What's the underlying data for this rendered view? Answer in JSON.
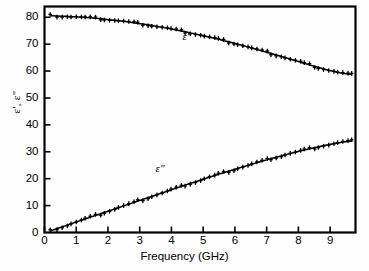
{
  "chart_data": {
    "type": "line",
    "title": "",
    "xlabel": "Frequency (GHz)",
    "ylabel": "ε', ε\"",
    "xlim": [
      0,
      9.8
    ],
    "ylim": [
      0,
      84
    ],
    "xticks": [
      0,
      1,
      2,
      3,
      4,
      5,
      6,
      7,
      8,
      9
    ],
    "xticklabels": [
      "0",
      "1",
      "2",
      "3",
      "4",
      "5",
      "6",
      "7",
      "8",
      "9"
    ],
    "yticks": [
      0,
      10,
      20,
      30,
      40,
      50,
      60,
      70,
      80
    ],
    "yticklabels": [
      "0",
      "10",
      "20",
      "30",
      "40",
      "50",
      "60",
      "70",
      "80"
    ],
    "grid": false,
    "legend_position": "inline-annotations",
    "annotations": [
      {
        "text": "ε'",
        "x": 4.35,
        "y": 72.5,
        "name": "epsilon-prime-label"
      },
      {
        "text": "ε\"",
        "x": 3.5,
        "y": 23.5,
        "name": "epsilon-double-prime-label"
      }
    ],
    "series": [
      {
        "name": "ε'",
        "marker": "+",
        "line": "solid",
        "x": [
          0.2,
          0.4,
          0.55,
          0.7,
          0.85,
          1.0,
          1.15,
          1.3,
          1.45,
          1.6,
          1.75,
          1.9,
          2.05,
          2.2,
          2.35,
          2.5,
          2.65,
          2.8,
          2.95,
          3.1,
          3.25,
          3.4,
          3.55,
          3.7,
          3.85,
          4.0,
          4.15,
          4.3,
          4.45,
          4.6,
          4.75,
          4.9,
          5.05,
          5.2,
          5.35,
          5.5,
          5.65,
          5.8,
          5.95,
          6.1,
          6.25,
          6.4,
          6.55,
          6.7,
          6.85,
          7.0,
          7.15,
          7.3,
          7.45,
          7.6,
          7.75,
          7.9,
          8.05,
          8.2,
          8.35,
          8.5,
          8.65,
          8.8,
          8.95,
          9.1,
          9.25,
          9.4,
          9.55,
          9.7
        ],
        "y": [
          80.6,
          80.5,
          80.4,
          80.4,
          80.2,
          80.2,
          80.0,
          79.9,
          79.8,
          79.6,
          79.5,
          79.3,
          79.1,
          78.9,
          78.7,
          78.5,
          78.2,
          78.0,
          77.7,
          77.5,
          77.2,
          76.9,
          76.6,
          76.3,
          76.0,
          75.6,
          75.3,
          74.9,
          74.6,
          74.2,
          73.8,
          73.4,
          73.0,
          72.6,
          72.2,
          71.8,
          71.3,
          70.9,
          70.4,
          70.0,
          69.5,
          69.0,
          68.5,
          68.0,
          67.5,
          67.0,
          66.5,
          66.0,
          65.5,
          65.0,
          64.4,
          63.9,
          63.4,
          62.8,
          62.3,
          61.8,
          61.3,
          60.8,
          60.3,
          59.9,
          59.5,
          59.2,
          58.9,
          58.7
        ]
      },
      {
        "name": "ε\"",
        "marker": "+",
        "line": "solid",
        "x": [
          0.2,
          0.4,
          0.55,
          0.7,
          0.85,
          1.0,
          1.15,
          1.3,
          1.45,
          1.6,
          1.75,
          1.9,
          2.05,
          2.2,
          2.35,
          2.5,
          2.65,
          2.8,
          2.95,
          3.1,
          3.25,
          3.4,
          3.55,
          3.7,
          3.85,
          4.0,
          4.15,
          4.3,
          4.45,
          4.6,
          4.75,
          4.9,
          5.05,
          5.2,
          5.35,
          5.5,
          5.65,
          5.8,
          5.95,
          6.1,
          6.25,
          6.4,
          6.55,
          6.7,
          6.85,
          7.0,
          7.15,
          7.3,
          7.45,
          7.6,
          7.75,
          7.9,
          8.05,
          8.2,
          8.35,
          8.5,
          8.65,
          8.8,
          8.95,
          9.1,
          9.25,
          9.4,
          9.55,
          9.7
        ],
        "y": [
          0.6,
          1.5,
          2.1,
          2.7,
          3.3,
          3.9,
          4.5,
          5.1,
          5.7,
          6.3,
          6.9,
          7.5,
          8.1,
          8.7,
          9.3,
          9.9,
          10.5,
          11.1,
          11.7,
          12.3,
          12.9,
          13.5,
          14.1,
          14.7,
          15.3,
          15.9,
          16.5,
          17.1,
          17.7,
          18.3,
          18.8,
          19.4,
          20.0,
          20.6,
          21.1,
          21.7,
          22.2,
          22.8,
          23.3,
          23.9,
          24.4,
          24.9,
          25.4,
          26.0,
          26.5,
          27.0,
          27.5,
          28.0,
          28.4,
          28.9,
          29.4,
          29.8,
          30.3,
          30.7,
          31.1,
          31.5,
          31.9,
          32.3,
          32.6,
          33.0,
          33.3,
          33.6,
          33.8,
          34.0
        ]
      }
    ]
  }
}
